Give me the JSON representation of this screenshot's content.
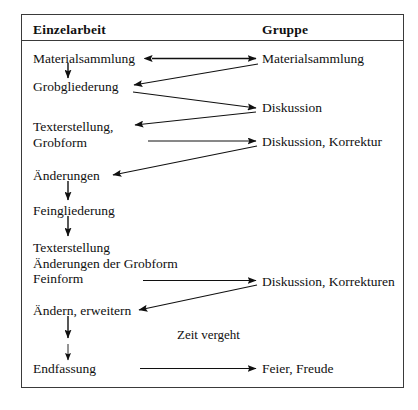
{
  "diagram": {
    "title_columns": {
      "left": "Einzelarbeit",
      "right": "Gruppe"
    },
    "left_column_steps": [
      {
        "id": "materialsammlung",
        "label": "Materialsammlung"
      },
      {
        "id": "grobgliederung",
        "label": "Grobgliederung"
      },
      {
        "id": "texterstellung-grobform",
        "label": "Texterstellung,\nGrobform",
        "lines": [
          "Texterstellung,",
          "Grobform"
        ]
      },
      {
        "id": "aenderungen",
        "label": "Änderungen"
      },
      {
        "id": "feingliederung",
        "label": "Feingliederung"
      },
      {
        "id": "texterstellung-feinform",
        "label": "Texterstellung\nÄnderungen der Grobform\nFeinform",
        "lines": [
          "Texterstellung",
          "Änderungen der Grobform",
          "Feinform"
        ]
      },
      {
        "id": "aendern-erweitern",
        "label": "Ändern, erweitern"
      },
      {
        "id": "endfassung",
        "label": "Endfassung"
      }
    ],
    "right_column_steps": [
      {
        "id": "gruppe-materialsammlung",
        "label": "Materialsammlung"
      },
      {
        "id": "gruppe-diskussion",
        "label": "Diskussion"
      },
      {
        "id": "gruppe-diskussion-korrektur",
        "label": "Diskussion, Korrektur"
      },
      {
        "id": "gruppe-diskussion-korrekturen",
        "label": "Diskussion, Korrekturen"
      },
      {
        "id": "gruppe-feier-freude",
        "label": "Feier, Freude"
      }
    ],
    "annotations": [
      {
        "id": "zeit-vergeht",
        "label": "Zeit vergeht"
      }
    ],
    "colors": {
      "ink": "#101010",
      "rule": "#3a3a3a",
      "background": "#ffffff"
    }
  }
}
